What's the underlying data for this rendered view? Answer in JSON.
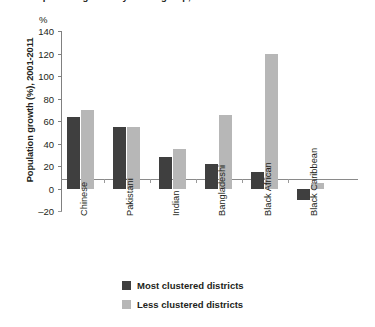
{
  "figure": {
    "cropped_title": "Population growth by ethnic group, most and least clustered districts",
    "unit_label": "%"
  },
  "legend": {
    "position": "below-plot",
    "entries": [
      {
        "label": "Most clustered districts",
        "color": "#3f3f3f"
      },
      {
        "label": "Less clustered districts",
        "color": "#b7b7b7"
      }
    ]
  },
  "chart_data": {
    "type": "bar",
    "title": "",
    "xlabel": "",
    "ylabel": "Population growth (%), 2001-2011",
    "ylim": [
      -20,
      140
    ],
    "ytick_step": 20,
    "yticks": [
      140,
      120,
      100,
      80,
      60,
      40,
      20,
      0,
      -20
    ],
    "ytick_labels": [
      "140",
      "120",
      "100",
      "80",
      "60",
      "40",
      "20",
      "0",
      "-20"
    ],
    "unit": "%",
    "grid": false,
    "legend_position": "bottom",
    "categories": [
      "Chinese",
      "Pakistani",
      "Indian",
      "Bangladeshi",
      "Black African",
      "Black Caribbean"
    ],
    "series": [
      {
        "name": "Most clustered districts",
        "color": "#3f3f3f",
        "values": [
          64,
          55,
          28,
          22,
          15,
          -10
        ]
      },
      {
        "name": "Less clustered districts",
        "color": "#b7b7b7",
        "values": [
          70,
          55,
          35,
          65,
          120,
          5
        ]
      }
    ]
  }
}
